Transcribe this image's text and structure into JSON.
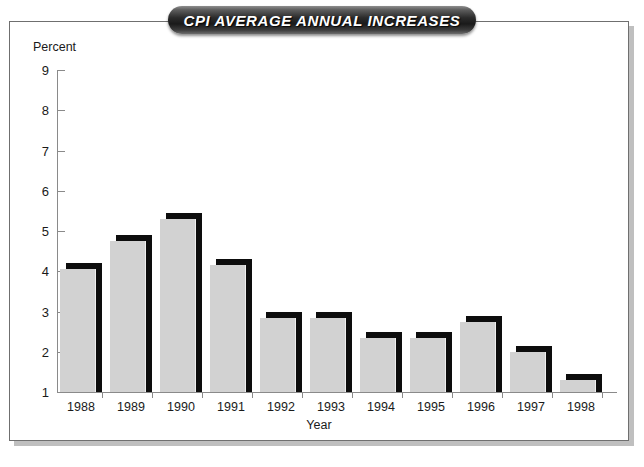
{
  "title": "CPI AVERAGE ANNUAL INCREASES",
  "chart_data": {
    "type": "bar",
    "title": "CPI AVERAGE ANNUAL INCREASES",
    "xlabel": "Year",
    "ylabel": "Percent",
    "categories": [
      "1988",
      "1989",
      "1990",
      "1991",
      "1992",
      "1993",
      "1994",
      "1995",
      "1996",
      "1997",
      "1998"
    ],
    "values": [
      4.2,
      4.9,
      5.45,
      4.3,
      3.0,
      3.0,
      2.5,
      2.5,
      2.9,
      2.15,
      1.45
    ],
    "ylim": [
      1,
      9
    ],
    "yticks": [
      1,
      2,
      3,
      4,
      5,
      6,
      7,
      8,
      9
    ],
    "ytick_labels": [
      "1",
      "2",
      "3",
      "4",
      "5",
      "6",
      "7",
      "8",
      "9"
    ],
    "grid": false,
    "legend": null,
    "bar_color": "#d2d2d2",
    "bar_shadow_color": "#0d0d0d",
    "axis_color": "#8a8a8a"
  },
  "colors": {
    "banner_dark": "#1a1a1a",
    "banner_light": "#8e8e8e",
    "title_text": "#ffffff",
    "frame_border": "#6f6f6f",
    "frame_shadow": "#bfbfbf",
    "background": "#ffffff",
    "text": "#1a1a1a"
  }
}
